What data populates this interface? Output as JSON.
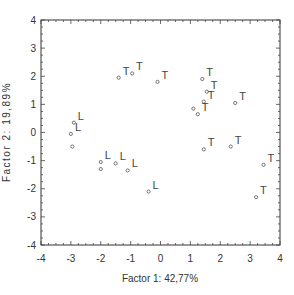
{
  "chart_data": {
    "type": "scatter",
    "title": "",
    "xlabel": "Factor 1: 42,77%",
    "ylabel": "Factor 2: 19,89%",
    "xlim": [
      -4,
      4
    ],
    "ylim": [
      -4,
      4
    ],
    "x_ticks": [
      "-4",
      "-3",
      "-2",
      "-1",
      "0",
      "1",
      "2",
      "3",
      "4"
    ],
    "y_ticks": [
      "4",
      "3",
      "2",
      "1",
      "0",
      "-1",
      "-2",
      "-3",
      "-4"
    ],
    "grid": false,
    "legend": null,
    "series": [
      {
        "name": "L",
        "marker": "small open circle",
        "points": [
          {
            "x": -2.9,
            "y": 0.35,
            "label": "L"
          },
          {
            "x": -3.0,
            "y": -0.05,
            "label": "L"
          },
          {
            "x": -2.95,
            "y": -0.5,
            "label": ""
          },
          {
            "x": -2.0,
            "y": -1.05,
            "label": "L"
          },
          {
            "x": -2.0,
            "y": -1.3,
            "label": ""
          },
          {
            "x": -1.5,
            "y": -1.1,
            "label": "L"
          },
          {
            "x": -1.1,
            "y": -1.35,
            "label": "L"
          },
          {
            "x": -0.4,
            "y": -2.1,
            "label": "L"
          }
        ]
      },
      {
        "name": "T",
        "marker": "small open circle",
        "points": [
          {
            "x": -1.4,
            "y": 1.95,
            "label": "T"
          },
          {
            "x": -0.95,
            "y": 2.1,
            "label": "T"
          },
          {
            "x": -0.1,
            "y": 1.8,
            "label": "T"
          },
          {
            "x": 1.4,
            "y": 1.9,
            "label": "T"
          },
          {
            "x": 1.55,
            "y": 1.45,
            "label": "T"
          },
          {
            "x": 1.45,
            "y": 1.1,
            "label": "T"
          },
          {
            "x": 1.1,
            "y": 0.85,
            "label": ""
          },
          {
            "x": 1.25,
            "y": 0.65,
            "label": "T"
          },
          {
            "x": 2.5,
            "y": 1.05,
            "label": "T"
          },
          {
            "x": 1.45,
            "y": -0.6,
            "label": "T"
          },
          {
            "x": 2.35,
            "y": -0.5,
            "label": "T"
          },
          {
            "x": 3.45,
            "y": -1.15,
            "label": "T"
          },
          {
            "x": 3.2,
            "y": -2.3,
            "label": "T"
          }
        ]
      }
    ]
  }
}
